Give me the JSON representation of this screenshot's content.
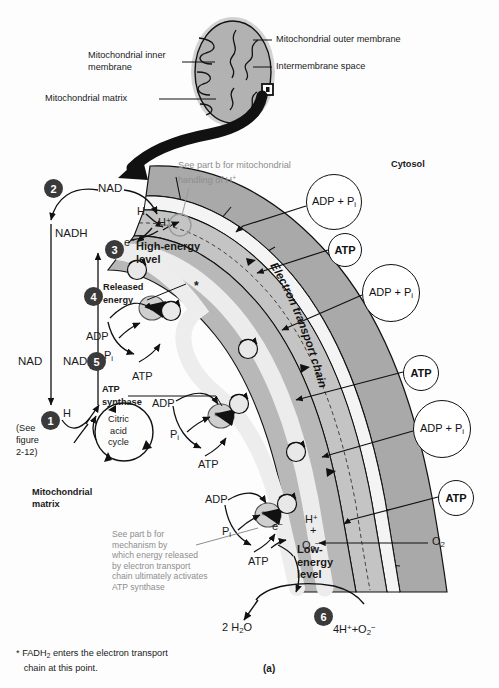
{
  "figure": {
    "panel_label": "(a)",
    "footnote": "FADH2 enters the electron transport chain at this point.",
    "footnote_marker": "*"
  },
  "inset": {
    "labels": [
      {
        "id": "outer-membrane",
        "text": "Mitochondrial outer membrane"
      },
      {
        "id": "intermembrane-space",
        "text": "Intermembrane space"
      },
      {
        "id": "inner-membrane",
        "text": "Mitochondrial inner\nmembrane"
      },
      {
        "id": "matrix",
        "text": "Mitochondrial matrix"
      }
    ]
  },
  "regions": {
    "cytosol": "Cytosol",
    "matrix": "Mitochondrial\nmatrix",
    "etc_band": "Electron transport chain"
  },
  "notes": {
    "h_handling": "See part b for mitochondrial\nhandling of H",
    "h_handling_sup": "+",
    "mechanism": "See part b for\nmechanism by\nwhich energy released\nby electron transport\nchain ultimately activates\nATP synthase"
  },
  "steps": [
    {
      "n": "1",
      "x": 41,
      "y": 411
    },
    {
      "n": "2",
      "x": 44,
      "y": 179
    },
    {
      "n": "3",
      "x": 105,
      "y": 240
    },
    {
      "n": "4",
      "x": 84,
      "y": 287
    },
    {
      "n": "5",
      "x": 87,
      "y": 352
    },
    {
      "n": "6",
      "x": 314,
      "y": 607
    }
  ],
  "step_labels": {
    "released_energy": "Released\nenergy",
    "atp_synthase": "ATP\nsynthase",
    "see_figure": "(See\nfigure\n2-12)",
    "citric_acid_cycle": "Citric\nacid\ncycle",
    "high_energy": "High-energy\nlevel",
    "low_energy": "Low-\nenergy\nlevel"
  },
  "molecules": {
    "nad": "NAD",
    "nadh": "NADH",
    "h": "H",
    "h_plus": "H",
    "electron": "e",
    "adp": "ADP",
    "pi": "P",
    "pi_sub": "i",
    "atp": "ATP",
    "adp_pi": "ADP + P",
    "o2": "O",
    "o2_sub": "2",
    "water_out": "2 H",
    "water_sub": "2",
    "water_tail": "O",
    "proton_oxide": "4H",
    "proton_oxide_mid": "+O",
    "asterisk": "*"
  },
  "cytosol_circles": [
    {
      "id": "adp-pi-1",
      "kind": "adp",
      "cx": 333,
      "cy": 201,
      "r": 27
    },
    {
      "id": "atp-1",
      "kind": "atp",
      "cx": 344,
      "cy": 249,
      "r": 16
    },
    {
      "id": "adp-pi-2",
      "kind": "adp",
      "cx": 390,
      "cy": 292,
      "r": 28
    },
    {
      "id": "atp-2",
      "kind": "atp",
      "cx": 420,
      "cy": 372,
      "r": 17
    },
    {
      "id": "adp-pi-3",
      "kind": "adp",
      "cx": 441,
      "cy": 428,
      "r": 28
    },
    {
      "id": "atp-3",
      "kind": "atp",
      "cx": 455,
      "cy": 497,
      "r": 17
    }
  ],
  "colors": {
    "outer_membrane": "#a9a9a9",
    "intermembrane": "#f2f2f2",
    "inner_membrane": "#c4c4c4",
    "etc_band": "#ededed",
    "matrix_shade": "#b8b8b8",
    "step_circle": "#3a3a3a",
    "note_gray": "#8d8d8d",
    "stroke": "#111111",
    "page": "#fdfdfd"
  }
}
